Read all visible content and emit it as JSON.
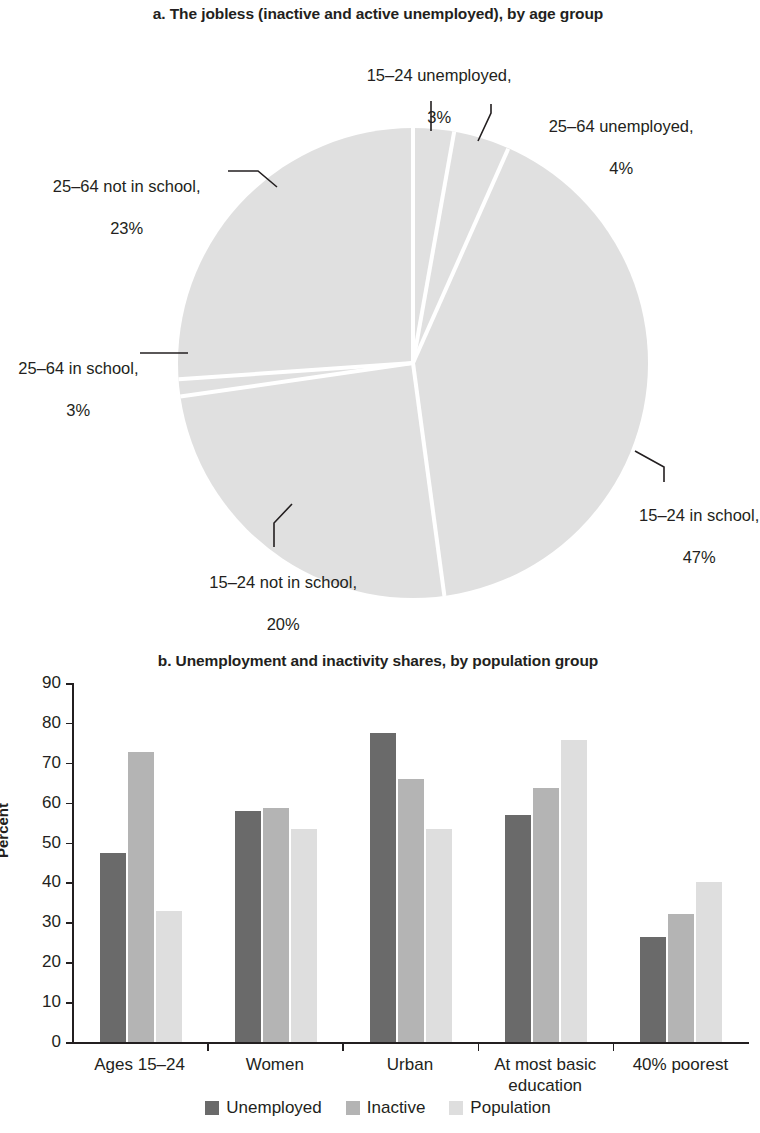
{
  "chart_data": [
    {
      "type": "pie",
      "title": "a. The jobless (inactive and active unemployed), by age group",
      "labels": [
        "15–24 unemployed,",
        "25–64 unemployed,",
        "15–24 in school,",
        "15–24 not in school,",
        "25–64 in school,",
        "25–64 not in school,"
      ],
      "value_labels": [
        "3%",
        "4%",
        "47%",
        "20%",
        "3%",
        "23%"
      ],
      "values": [
        3,
        4,
        47,
        20,
        3,
        23
      ],
      "start_angle_deg": 0,
      "direction": "clockwise",
      "slice_color": "#e0e0e0",
      "separator_color": "#ffffff",
      "legend": "none"
    },
    {
      "type": "bar",
      "title": "b. Unemployment and inactivity shares, by population group",
      "categories": [
        "Ages 15–24",
        "Women",
        "Urban",
        "At most basic education",
        "40% poorest"
      ],
      "series": [
        {
          "name": "Unemployed",
          "color": "#6a6a6a",
          "values": [
            47.5,
            57.8,
            77.5,
            56.8,
            26.4
          ]
        },
        {
          "name": "Inactive",
          "color": "#b4b4b4",
          "values": [
            72.6,
            58.6,
            66.0,
            63.6,
            32.1
          ]
        },
        {
          "name": "Population",
          "color": "#dedede",
          "values": [
            32.8,
            53.4,
            53.4,
            75.7,
            40.1
          ]
        }
      ],
      "ylabel": "Percent",
      "xlabel": "",
      "ylim": [
        0,
        90
      ],
      "yticks": [
        0,
        10,
        20,
        30,
        40,
        50,
        60,
        70,
        80,
        90
      ],
      "ytick_labels": [
        "0",
        "10",
        "20",
        "30",
        "40",
        "50",
        "60",
        "70",
        "80",
        "90"
      ],
      "grid": false,
      "legend_position": "bottom"
    }
  ],
  "panel_a": {
    "title": "a. The jobless (inactive and active unemployed), by age group",
    "labels": [
      {
        "name": "15–24 unemployed,",
        "value": "3%"
      },
      {
        "name": "25–64 unemployed,",
        "value": "4%"
      },
      {
        "name": "15–24 in school,",
        "value": "47%"
      },
      {
        "name": "15–24 not in school,",
        "value": "20%"
      },
      {
        "name": "25–64 in school,",
        "value": "3%"
      },
      {
        "name": "25–64 not in school,",
        "value": "23%"
      }
    ]
  },
  "panel_b": {
    "title": "b. Unemployment and inactivity shares, by population group",
    "y_axis_title": "Percent",
    "y_ticks": [
      "90",
      "80",
      "70",
      "60",
      "50",
      "40",
      "30",
      "20",
      "10",
      "0"
    ],
    "categories": [
      "Ages 15–24",
      "Women",
      "Urban",
      "At most basic\neducation",
      "40% poorest"
    ],
    "legend": [
      "Unemployed",
      "Inactive",
      "Population"
    ]
  }
}
